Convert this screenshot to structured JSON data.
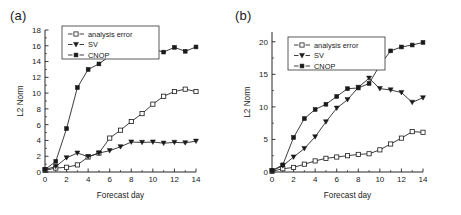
{
  "figure": {
    "panels": [
      {
        "label": "(a)",
        "xlabel": "Forecast day",
        "ylabel": "L2 Norm"
      },
      {
        "label": "(b)",
        "xlabel": "Forecast day",
        "ylabel": "L2 Norm"
      }
    ],
    "legend": {
      "analysis_error": "analysis error",
      "sv": "SV",
      "cnop": "CNOP"
    },
    "colors": {
      "line": "#1a1a1a",
      "analysis_error_marker": "#ffffff",
      "sv_marker": "#1a1a1a",
      "cnop_marker": "#1a1a1a",
      "axis": "#262626",
      "background": "#ffffff"
    }
  },
  "chart_data": [
    {
      "type": "line",
      "title": "(a)",
      "xlabel": "Forecast day",
      "ylabel": "L2 Norm",
      "x": [
        0,
        1,
        2,
        3,
        4,
        5,
        6,
        7,
        8,
        9,
        10,
        11,
        12,
        13,
        14
      ],
      "xlim": [
        0,
        14
      ],
      "ylim": [
        0,
        18
      ],
      "xticks": [
        0,
        2,
        4,
        6,
        8,
        10,
        12,
        14
      ],
      "yticks": [
        0,
        2,
        4,
        6,
        8,
        10,
        12,
        14,
        16,
        18
      ],
      "grid": false,
      "legend_position": "upper left",
      "series": [
        {
          "name": "analysis error",
          "marker": "open-square",
          "values": [
            0.2,
            0.5,
            0.6,
            0.9,
            1.9,
            2.4,
            4.3,
            5.3,
            6.4,
            7.4,
            8.6,
            9.6,
            10.2,
            10.5,
            10.2
          ]
        },
        {
          "name": "SV",
          "marker": "filled-triangle-down",
          "values": [
            0.3,
            0.7,
            1.8,
            2.4,
            1.95,
            2.4,
            2.7,
            3.2,
            3.8,
            3.75,
            3.8,
            3.65,
            3.75,
            3.7,
            3.9
          ]
        },
        {
          "name": "CNOP",
          "marker": "filled-square",
          "values": [
            0.3,
            1.35,
            5.5,
            10.7,
            13.0,
            13.7,
            14.7,
            14.9,
            15.4,
            15.6,
            15.6,
            15.2,
            15.8,
            15.3,
            15.85
          ]
        }
      ]
    },
    {
      "type": "line",
      "title": "(b)",
      "xlabel": "Forecast day",
      "ylabel": "L2 Norm",
      "x": [
        0,
        1,
        2,
        3,
        4,
        5,
        6,
        7,
        8,
        9,
        10,
        11,
        12,
        13,
        14
      ],
      "xlim": [
        0,
        14
      ],
      "ylim": [
        0,
        21.5
      ],
      "xticks": [
        0,
        2,
        4,
        6,
        8,
        10,
        12,
        14
      ],
      "yticks": [
        0,
        5,
        10,
        15,
        20
      ],
      "grid": false,
      "legend_position": "upper left",
      "series": [
        {
          "name": "analysis error",
          "marker": "open-square",
          "values": [
            0.1,
            0.5,
            0.7,
            1.2,
            1.7,
            2.1,
            2.3,
            2.5,
            2.7,
            2.8,
            3.4,
            4.3,
            5.2,
            6.2,
            6.1
          ]
        },
        {
          "name": "SV",
          "marker": "filled-triangle-down",
          "values": [
            0.2,
            0.95,
            2.3,
            3.6,
            5.4,
            7.7,
            9.8,
            11.1,
            13.0,
            14.4,
            12.8,
            12.6,
            12.2,
            10.7,
            11.4
          ]
        },
        {
          "name": "CNOP",
          "marker": "filled-square",
          "values": [
            0.2,
            1.1,
            5.3,
            8.2,
            9.6,
            10.4,
            11.6,
            12.8,
            12.9,
            13.6,
            16.4,
            18.6,
            19.2,
            19.5,
            19.9
          ]
        }
      ]
    }
  ]
}
